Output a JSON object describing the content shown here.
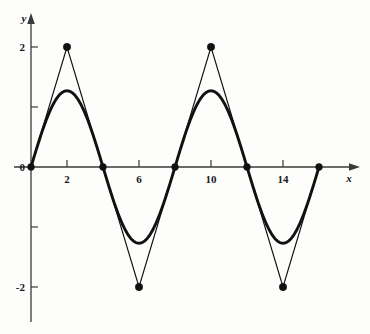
{
  "chart_data": {
    "type": "line",
    "title": "",
    "xlabel": "x",
    "ylabel": "y",
    "xlim": [
      -0.6,
      18.1
    ],
    "ylim": [
      -2.65,
      2.55
    ],
    "grid": false,
    "legend": "none",
    "x_ticks": [
      2,
      6,
      10,
      14
    ],
    "x_tick_labels": [
      "2",
      "6",
      "10",
      "14"
    ],
    "x_minor_ticks": [
      4,
      8,
      12,
      16
    ],
    "y_ticks": [
      2,
      0,
      -2
    ],
    "y_tick_labels": [
      "2",
      "0",
      "-2"
    ],
    "y_minor_ticks": [
      1,
      -1
    ],
    "series": [
      {
        "name": "triangle-wave",
        "style": "thin-polyline-with-markers",
        "period": 8,
        "amplitude": 2,
        "points": [
          [
            0,
            0
          ],
          [
            2,
            2
          ],
          [
            4,
            0
          ],
          [
            6,
            -2
          ],
          [
            8,
            0
          ],
          [
            10,
            2
          ],
          [
            12,
            0
          ],
          [
            14,
            -2
          ],
          [
            16,
            0
          ]
        ],
        "marker_points": [
          [
            0,
            0
          ],
          [
            2,
            2
          ],
          [
            4,
            0
          ],
          [
            6,
            -2
          ],
          [
            8,
            0
          ],
          [
            10,
            2
          ],
          [
            12,
            0
          ],
          [
            14,
            -2
          ],
          [
            16,
            0
          ]
        ]
      },
      {
        "name": "fourier-first-harmonic",
        "style": "thick-smooth-curve",
        "period": 8,
        "amplitude": 1.27,
        "formula_amplitude": 1.27,
        "x_range": [
          0,
          16
        ]
      }
    ],
    "annotations": []
  },
  "axes": {
    "y_axis_label": "y",
    "x_axis_label": "x",
    "origin_label": "0"
  },
  "colors": {
    "curve": "#111111",
    "axis": "#3a3a3a",
    "background": "#fdfdfc",
    "text": "#171717"
  }
}
